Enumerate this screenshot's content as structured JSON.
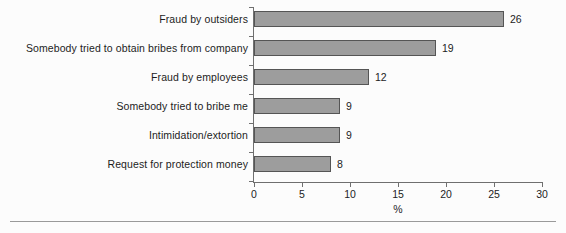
{
  "chart_data": {
    "type": "bar",
    "orientation": "horizontal",
    "title": "",
    "subtitle": "",
    "xlabel": "%",
    "ylabel": "",
    "xlim": [
      0,
      30
    ],
    "xticks": [
      0,
      5,
      10,
      15,
      20,
      25,
      30
    ],
    "xtick_labels": [
      "0",
      "5",
      "10",
      "15",
      "20",
      "25",
      "30"
    ],
    "grid": false,
    "legend": null,
    "bar_color": "#9d9d9d",
    "bar_border_color": "#555555",
    "axis_color": "#6f6f6f",
    "text_color": "#1d1d1d",
    "background": "#fcfcfc",
    "categories": [
      "Fraud by outsiders",
      "Somebody tried to obtain bribes from company",
      "Fraud by employees",
      "Somebody tried to bribe me",
      "Intimidation/extortion",
      "Request for protection money"
    ],
    "values": [
      26,
      19,
      12,
      9,
      9,
      8
    ],
    "value_labels": [
      "26",
      "19",
      "12",
      "9",
      "9",
      "8"
    ]
  }
}
